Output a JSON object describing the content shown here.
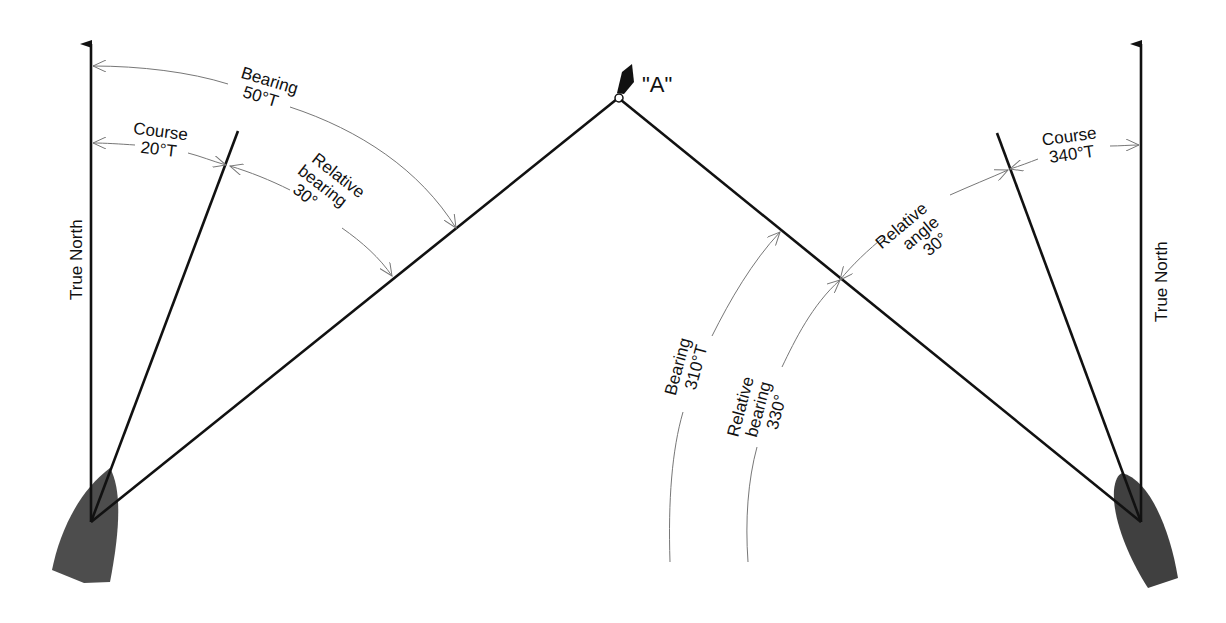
{
  "diagram": {
    "colors": {
      "line": "#111111",
      "arc": "#777777",
      "hull": "#4d4d4d",
      "buoy": "#111111",
      "background": "#ffffff"
    },
    "object": {
      "label": "\"A\"",
      "icon": "buoy-icon"
    },
    "left_vessel": {
      "north_label": "True North",
      "course": {
        "line1": "Course",
        "line2": "20°T"
      },
      "bearing": {
        "line1": "Bearing",
        "line2": "50°T"
      },
      "relative_bearing": {
        "line1": "Relative",
        "line2": "bearing",
        "line3": "30°"
      }
    },
    "right_vessel": {
      "north_label": "True North",
      "course": {
        "line1": "Course",
        "line2": "340°T"
      },
      "relative_angle": {
        "line1": "Relative",
        "line2": "angle",
        "line3": "30°"
      },
      "bearing": {
        "line1": "Bearing",
        "line2": "310°T"
      },
      "relative_bearing": {
        "line1": "Relative",
        "line2": "bearing",
        "line3": "330°"
      }
    }
  }
}
